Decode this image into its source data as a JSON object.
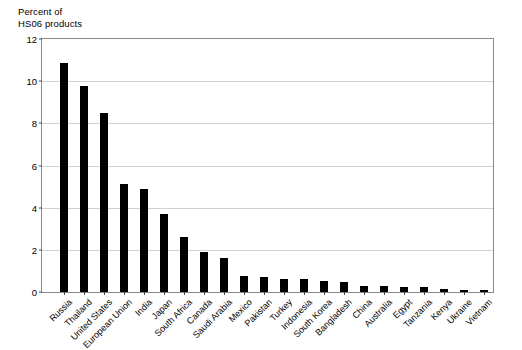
{
  "chart": {
    "y_axis_title": "Percent of\nHS06 products"
  },
  "chart_data": {
    "type": "bar",
    "title": "",
    "xlabel": "",
    "ylabel": "Percent of HS06 products",
    "ylim": [
      0,
      12
    ],
    "yticks": [
      0,
      2,
      4,
      6,
      8,
      10,
      12
    ],
    "grid": true,
    "legend": "none",
    "bar_color": "#000000",
    "categories": [
      "Russia",
      "Thailand",
      "United States",
      "European Union",
      "India",
      "Japan",
      "South Africa",
      "Canada",
      "Saudi Arabia",
      "Mexico",
      "Pakistan",
      "Turkey",
      "Indonesia",
      "South Korea",
      "Bangladesh",
      "China",
      "Australia",
      "Egypt",
      "Tanzania",
      "Kenya",
      "Ukraine",
      "Vietnam"
    ],
    "values": [
      10.85,
      9.75,
      8.5,
      5.1,
      4.9,
      3.7,
      2.6,
      1.9,
      1.6,
      0.75,
      0.7,
      0.62,
      0.6,
      0.5,
      0.48,
      0.3,
      0.28,
      0.25,
      0.22,
      0.12,
      0.1,
      0.1
    ]
  }
}
